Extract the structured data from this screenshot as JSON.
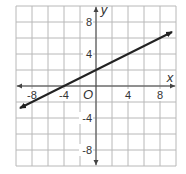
{
  "chart_data": {
    "type": "line",
    "title": "",
    "xlabel": "x",
    "ylabel": "y",
    "origin_label": "O",
    "xlim": [
      -10,
      10
    ],
    "ylim": [
      -10,
      10
    ],
    "grid": true,
    "grid_step": 2,
    "x_ticks": [
      "-8",
      "-4",
      "4",
      "8"
    ],
    "y_ticks": [
      "8",
      "4",
      "-4",
      "-8"
    ],
    "series": [
      {
        "name": "line",
        "equation": "y = 0.5x + 2",
        "x": [
          -9.5,
          -4,
          0,
          4,
          8,
          9.5
        ],
        "y": [
          -2.75,
          0,
          2,
          4,
          6,
          6.75
        ],
        "arrows": "both",
        "color": "#222222"
      }
    ],
    "legend": null
  },
  "colors": {
    "grid": "#b8b8b8",
    "axis": "#444444",
    "line": "#222222"
  }
}
